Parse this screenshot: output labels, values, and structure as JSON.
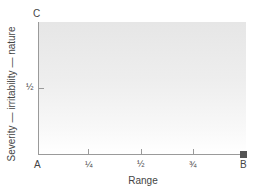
{
  "diagram": {
    "x_axis": {
      "label": "Range",
      "start_label": "A",
      "end_label": "B",
      "ticks": [
        "¼",
        "½",
        "¾"
      ]
    },
    "y_axis": {
      "label": "Severity — irritability — nature",
      "top_label": "C",
      "ticks": [
        "½"
      ]
    },
    "colors": {
      "axis": "#9a9a9a",
      "shade_top": "#e6e6e6",
      "shade_bottom": "#ffffff",
      "endpoint_marker": "#555555"
    }
  }
}
